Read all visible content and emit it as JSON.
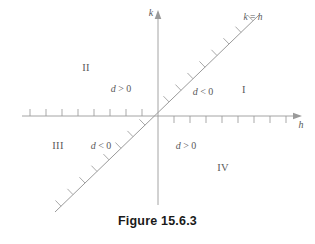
{
  "figure": {
    "caption": "Figure 15.6.3",
    "background_color": "#ffffff",
    "line_color": "#9a9a9a",
    "text_color": "#5a5a5a",
    "caption_color": "#1a1a1a"
  },
  "axes": {
    "horizontal": {
      "name": "h-axis",
      "label": "h",
      "label_x": 301,
      "label_y": 125,
      "y": 116,
      "x_start": 22,
      "x_end": 296,
      "arrow": "right"
    },
    "vertical": {
      "name": "k-axis",
      "label": "k",
      "label_x": 151,
      "label_y": 13,
      "x": 158,
      "y_start": 205,
      "y_end": 16,
      "arrow": "up"
    },
    "origin": {
      "x": 158,
      "y": 116
    }
  },
  "diagonal": {
    "name": "line-k-equals-h",
    "label": "k = h",
    "label_x": 253,
    "label_y": 18,
    "x1": 55,
    "y1": 212,
    "x2": 259,
    "y2": 15,
    "hatch_count": 16,
    "hatch_length": 8
  },
  "ticks": {
    "h_left": {
      "count": 8,
      "spacing": 16,
      "direction": "up",
      "length": 7
    },
    "h_right": {
      "count": 9,
      "spacing": 16,
      "direction": "down",
      "length": 7
    }
  },
  "annotations": [
    {
      "id": "quadrant-ii",
      "text": "II",
      "kind": "quadrant",
      "x": 86,
      "y": 68
    },
    {
      "id": "quadrant-i",
      "text": "I",
      "kind": "quadrant",
      "x": 244,
      "y": 90
    },
    {
      "id": "quadrant-iii",
      "text": "III",
      "kind": "quadrant",
      "x": 58,
      "y": 146
    },
    {
      "id": "quadrant-iv",
      "text": "IV",
      "kind": "quadrant",
      "x": 223,
      "y": 168
    },
    {
      "id": "discriminant-ii",
      "text": "d > 0",
      "kind": "discriminant",
      "x": 121,
      "y": 89
    },
    {
      "id": "discriminant-i",
      "text": "d < 0",
      "kind": "discriminant",
      "x": 203,
      "y": 92
    },
    {
      "id": "discriminant-iii",
      "text": "d < 0",
      "kind": "discriminant",
      "x": 101,
      "y": 146
    },
    {
      "id": "discriminant-iv",
      "text": "d > 0",
      "kind": "discriminant",
      "x": 186,
      "y": 146
    }
  ],
  "chart_data": {
    "type": "diagram",
    "title": "Figure 15.6.3",
    "xlabel": "h",
    "ylabel": "k",
    "regions": [
      {
        "quadrant": "I",
        "discriminant": "d < 0"
      },
      {
        "quadrant": "II",
        "discriminant": "d > 0"
      },
      {
        "quadrant": "III",
        "discriminant": "d < 0"
      },
      {
        "quadrant": "IV",
        "discriminant": "d > 0"
      }
    ],
    "lines": [
      {
        "equation": "k = h",
        "slope": 1,
        "intercept": 0,
        "hatched": true
      }
    ],
    "grid": false,
    "legend": "none"
  }
}
